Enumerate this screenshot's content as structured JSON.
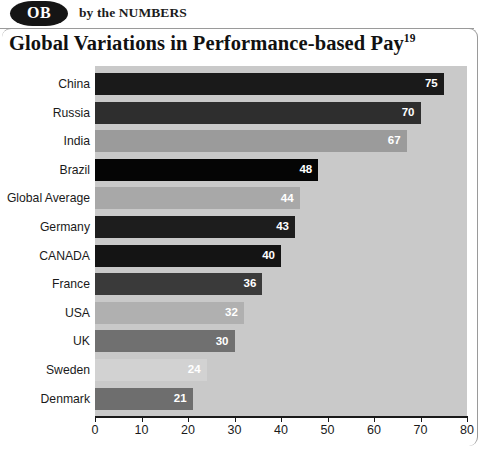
{
  "header": {
    "badge_text": "OB",
    "byline": "by the NUMBERS"
  },
  "chart_title_main": "Global Variations in Performance-based Pay",
  "chart_title_superscript": "19",
  "chart_data": {
    "type": "bar",
    "orientation": "horizontal",
    "title": "Global Variations in Performance-based Pay",
    "xlabel": "",
    "ylabel": "",
    "xlim": [
      0,
      80
    ],
    "grid": false,
    "legend": "none",
    "categories": [
      "China",
      "Russia",
      "India",
      "Brazil",
      "Global Average",
      "Germany",
      "CANADA",
      "France",
      "USA",
      "UK",
      "Sweden",
      "Denmark"
    ],
    "values": [
      75,
      70,
      67,
      48,
      44,
      43,
      40,
      36,
      32,
      30,
      24,
      21
    ],
    "value_labels": [
      "75",
      "70",
      "67",
      "48",
      "44",
      "43",
      "40",
      "36",
      "32",
      "30",
      "24",
      "21"
    ],
    "bar_colors": [
      "#1a1a1a",
      "#2e2e2e",
      "#9b9b9b",
      "#050505",
      "#a8a8a8",
      "#1d1d1d",
      "#141414",
      "#3a3a3a",
      "#b0b0b0",
      "#707070",
      "#d2d2d2",
      "#6e6e6e"
    ],
    "xticks": [
      0,
      10,
      20,
      30,
      40,
      50,
      60,
      70,
      80
    ],
    "xtick_labels": [
      "0",
      "10",
      "20",
      "30",
      "40",
      "50",
      "60",
      "70",
      "80"
    ],
    "plot_background": "#c9c9c9"
  },
  "colors": {
    "plot_background": "#c9c9c9",
    "axis": "#1a1a1a",
    "frame": "#9a9a9a",
    "badge": "#151515",
    "text": "#111111"
  }
}
